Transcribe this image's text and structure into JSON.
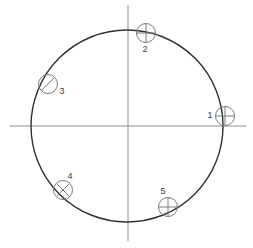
{
  "figure": {
    "type": "geometric-diagram",
    "canvas": {
      "width": 253,
      "height": 248
    },
    "background_color": "#ffffff"
  },
  "axes": {
    "color": "#8d8d8d",
    "stroke_width": 1,
    "horizontal": {
      "name": "x-axis",
      "x1": 10,
      "y1": 126,
      "x2": 246,
      "y2": 126
    },
    "vertical": {
      "name": "y-axis",
      "x1": 128,
      "y1": 5,
      "x2": 128,
      "y2": 241
    },
    "origin": {
      "x": 128,
      "y": 126
    }
  },
  "main_circle": {
    "name": "main-circle",
    "center_x": 127,
    "center_y": 126,
    "radius": 96,
    "stroke_color": "#2f2f2f",
    "stroke_width": 1.4,
    "fill": "none"
  },
  "markers": [
    {
      "id": "1",
      "label": "1",
      "center_x": 225,
      "center_y": 116,
      "radius": 9.5,
      "stroke_color": "#7a7a7a",
      "inner_mark": "plus",
      "label_x": 210,
      "label_y": 116,
      "label_anchor": "middle",
      "position_note": "right of circle, on horizontal axis"
    },
    {
      "id": "2",
      "label": "2",
      "center_x": 146,
      "center_y": 33,
      "radius": 9.5,
      "stroke_color": "#7a7a7a",
      "inner_mark": "plus",
      "label_x": 145,
      "label_y": 50,
      "label_anchor": "middle",
      "position_note": "top of circle, right of vertical axis"
    },
    {
      "id": "3",
      "label": "3",
      "center_x": 48,
      "center_y": 84,
      "radius": 9.5,
      "stroke_color": "#7a7a7a",
      "inner_mark": "slash",
      "label_x": 62,
      "label_y": 92,
      "label_anchor": "middle",
      "position_note": "upper-left of circle"
    },
    {
      "id": "4",
      "label": "4",
      "center_x": 63,
      "center_y": 190,
      "radius": 9.5,
      "stroke_color": "#7a7a7a",
      "inner_mark": "cross",
      "label_x": 70,
      "label_y": 177,
      "label_anchor": "middle",
      "position_note": "lower-left of circle"
    },
    {
      "id": "5",
      "label": "5",
      "center_x": 168,
      "center_y": 207,
      "radius": 9.5,
      "stroke_color": "#7a7a7a",
      "inner_mark": "plus",
      "label_x": 163,
      "label_y": 192,
      "label_anchor": "middle",
      "position_note": "lower-right of circle"
    }
  ]
}
